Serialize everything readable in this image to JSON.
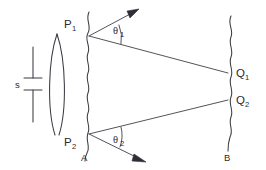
{
  "figure": {
    "background_color": "#ffffff",
    "stroke_color": "#3a3a42",
    "width": 266,
    "height": 170
  },
  "labels": {
    "source_size": "s",
    "point_p1": "P",
    "point_p1_sub": "1",
    "point_p2": "P",
    "point_p2_sub": "2",
    "point_q1": "Q",
    "point_q1_sub": "1",
    "point_q2": "Q",
    "point_q2_sub": "2",
    "plane_a": "A",
    "plane_b": "B",
    "angle_theta1": "θ",
    "angle_theta1_sub": "1",
    "angle_theta2": "θ",
    "angle_theta2_sub": "2"
  },
  "elements": {
    "lens": "biconvex-lens",
    "aperture_plane": "wavy-line-A",
    "screen_plane": "wavy-line-B",
    "dimension_marker": "source-size-bracket",
    "ray_p1_q1": "straight-ray",
    "ray_p2_q2": "straight-ray",
    "arrow_p1": "diffraction-arrow-up",
    "arrow_p2": "diffraction-arrow-down",
    "arc_theta1": "angle-arc",
    "arc_theta2": "angle-arc"
  }
}
